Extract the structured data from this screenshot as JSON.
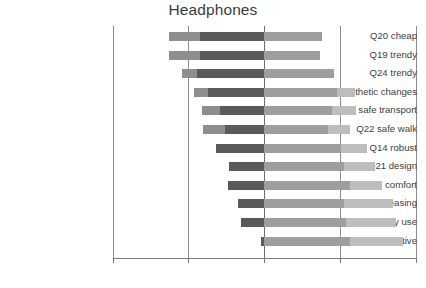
{
  "chart_data": {
    "type": "bar",
    "subtype": "diverging-stacked-horizontal",
    "title": "Headphones",
    "xlabel": "",
    "ylabel": "",
    "xlim": [
      -100,
      100
    ],
    "xticks": [
      -100,
      -50,
      0,
      50,
      100
    ],
    "xtick_labels": [
      "-100%",
      "-50%",
      "0%",
      "50%",
      "100%"
    ],
    "grid": true,
    "gridlines_at": [
      -100,
      -50,
      0,
      50,
      100
    ],
    "legend": null,
    "categories": [
      "Q20 cheap",
      "Q19 trendy",
      "Q24 trendy",
      "Q17 aesthetic changes",
      "Q23 safe transport",
      "Q22 safe walk",
      "Q14 robust",
      "Q21 design",
      "Q13 comfort",
      "Q16 aesthetic pleasing",
      "Q18 easy use",
      "Q15 intuitive"
    ],
    "segment_names": [
      "strongly negative",
      "negative",
      "positive",
      "strongly positive"
    ],
    "segment_colors": [
      "#8e8e8e",
      "#5a5a5a",
      "#9e9e9e",
      "#bdbdbd"
    ],
    "series": [
      {
        "name": "strongly negative",
        "values": [
          -63,
          -63,
          -54,
          -46,
          -41,
          -40,
          -32,
          -23,
          -24,
          -17,
          -15,
          -2
        ]
      },
      {
        "name": "negative",
        "values": [
          -42,
          -42,
          -44,
          -37,
          -29,
          -26,
          -32,
          -23,
          -24,
          -17,
          -15,
          -2
        ]
      },
      {
        "name": "positive",
        "values": [
          38,
          37,
          46,
          48,
          45,
          42,
          51,
          53,
          57,
          53,
          54,
          57
        ]
      },
      {
        "name": "strongly positive",
        "values": [
          38,
          37,
          46,
          60,
          61,
          57,
          68,
          73,
          78,
          85,
          87,
          92
        ]
      }
    ],
    "bars": [
      {
        "category": "Q20 cheap",
        "neg_outer": -63,
        "neg_inner": -42,
        "pos_inner": 38,
        "pos_outer": 38
      },
      {
        "category": "Q19 trendy",
        "neg_outer": -63,
        "neg_inner": -42,
        "pos_inner": 37,
        "pos_outer": 37
      },
      {
        "category": "Q24 trendy",
        "neg_outer": -54,
        "neg_inner": -44,
        "pos_inner": 46,
        "pos_outer": 46
      },
      {
        "category": "Q17 aesthetic changes",
        "neg_outer": -46,
        "neg_inner": -37,
        "pos_inner": 48,
        "pos_outer": 60
      },
      {
        "category": "Q23 safe transport",
        "neg_outer": -41,
        "neg_inner": -29,
        "pos_inner": 45,
        "pos_outer": 61
      },
      {
        "category": "Q22 safe walk",
        "neg_outer": -40,
        "neg_inner": -26,
        "pos_inner": 42,
        "pos_outer": 57
      },
      {
        "category": "Q14 robust",
        "neg_outer": -32,
        "neg_inner": -32,
        "pos_inner": 51,
        "pos_outer": 68
      },
      {
        "category": "Q21 design",
        "neg_outer": -23,
        "neg_inner": -23,
        "pos_inner": 53,
        "pos_outer": 73
      },
      {
        "category": "Q13 comfort",
        "neg_outer": -24,
        "neg_inner": -24,
        "pos_inner": 57,
        "pos_outer": 78
      },
      {
        "category": "Q16 aesthetic pleasing",
        "neg_outer": -17,
        "neg_inner": -17,
        "pos_inner": 53,
        "pos_outer": 85
      },
      {
        "category": "Q18 easy use",
        "neg_outer": -15,
        "neg_inner": -15,
        "pos_inner": 54,
        "pos_outer": 87
      },
      {
        "category": "Q15 intuitive",
        "neg_outer": -2,
        "neg_inner": -2,
        "pos_inner": 57,
        "pos_outer": 92
      }
    ]
  }
}
